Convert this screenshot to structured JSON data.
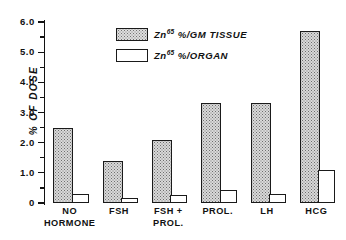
{
  "chart_data": {
    "type": "bar",
    "title": "",
    "xlabel": "",
    "ylabel": "% OF DOSE",
    "ylim": [
      0,
      6.0
    ],
    "ytick_labels": [
      "0",
      "1.0",
      "2.0",
      "3.0",
      "4.0",
      "5.0",
      "6.0"
    ],
    "ytick_values": [
      0,
      1.0,
      2.0,
      3.0,
      4.0,
      5.0,
      6.0
    ],
    "minor_tick_step": 0.5,
    "grid": false,
    "legend_position": "top-center",
    "categories": [
      "NO HORMONE",
      "FSH",
      "FSH + PROL.",
      "PROL.",
      "LH",
      "HCG"
    ],
    "category_lines": [
      [
        "NO",
        "HORMONE"
      ],
      [
        "FSH",
        ""
      ],
      [
        "FSH +",
        "PROL."
      ],
      [
        "PROL.",
        ""
      ],
      [
        "LH",
        ""
      ],
      [
        "HCG",
        ""
      ]
    ],
    "series": [
      {
        "name": "Zn65 %/GM TISSUE",
        "fill": "stippled",
        "values": [
          2.5,
          1.4,
          2.1,
          3.3,
          3.3,
          5.7
        ]
      },
      {
        "name": "Zn65 %/ORGAN",
        "fill": "white",
        "values": [
          0.3,
          0.18,
          0.27,
          0.42,
          0.3,
          1.08
        ]
      }
    ]
  },
  "legend": {
    "entries": [
      {
        "label_prefix": "Zn",
        "sup": "65",
        "label_suffix": " %/GM TISSUE",
        "fill": "stippled"
      },
      {
        "label_prefix": "Zn",
        "sup": "65",
        "label_suffix": " %/ORGAN",
        "fill": "white"
      }
    ]
  },
  "colors": {
    "ink": "#111111",
    "bar_stipple_fill": "#d9d9d9",
    "bar_white_fill": "#ffffff",
    "background": "#ffffff"
  }
}
